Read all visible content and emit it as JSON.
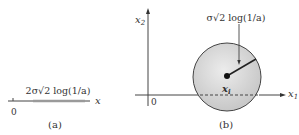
{
  "panel_a": {
    "axis_label": "x",
    "origin_label": "0",
    "interval_label": "2σ√2 log(1/a)",
    "caption": "(a)"
  },
  "panel_b": {
    "x_axis_label": "x",
    "x_axis_sub": "1",
    "y_axis_label": "x",
    "y_axis_sub": "2",
    "origin_label": "0",
    "center_label": "x",
    "center_sub": "i",
    "radius_label": "σ√2 log(1/a)",
    "caption": "(b)"
  },
  "colors": {
    "line": "#333333",
    "interval_fill": "#9a9a9a",
    "circle_fill": "#d4d4d4",
    "circle_stroke": "#444444"
  }
}
